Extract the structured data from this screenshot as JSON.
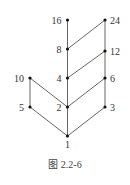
{
  "diagram": {
    "type": "hasse-diagram",
    "caption": "图 2.2-6",
    "nodes": [
      {
        "id": "1",
        "label": "1",
        "x": 67.5,
        "y": 136,
        "label_pos": "below"
      },
      {
        "id": "2",
        "label": "2",
        "x": 67.5,
        "y": 107,
        "label_pos": "left"
      },
      {
        "id": "3",
        "label": "3",
        "x": 105,
        "y": 107,
        "label_pos": "right"
      },
      {
        "id": "5",
        "label": "5",
        "x": 30,
        "y": 107,
        "label_pos": "left"
      },
      {
        "id": "4",
        "label": "4",
        "x": 67.5,
        "y": 78,
        "label_pos": "left"
      },
      {
        "id": "6",
        "label": "6",
        "x": 105,
        "y": 78,
        "label_pos": "right"
      },
      {
        "id": "10",
        "label": "10",
        "x": 30,
        "y": 78,
        "label_pos": "left"
      },
      {
        "id": "8",
        "label": "8",
        "x": 67.5,
        "y": 49,
        "label_pos": "left"
      },
      {
        "id": "12",
        "label": "12",
        "x": 105,
        "y": 51,
        "label_pos": "right"
      },
      {
        "id": "16",
        "label": "16",
        "x": 67.5,
        "y": 20,
        "label_pos": "left"
      },
      {
        "id": "24",
        "label": "24",
        "x": 105,
        "y": 20,
        "label_pos": "right"
      }
    ],
    "edges": [
      [
        "1",
        "2"
      ],
      [
        "1",
        "5"
      ],
      [
        "1",
        "3"
      ],
      [
        "2",
        "4"
      ],
      [
        "2",
        "10"
      ],
      [
        "2",
        "6"
      ],
      [
        "5",
        "10"
      ],
      [
        "3",
        "6"
      ],
      [
        "4",
        "8"
      ],
      [
        "4",
        "12"
      ],
      [
        "6",
        "12"
      ],
      [
        "8",
        "16"
      ],
      [
        "8",
        "24"
      ],
      [
        "12",
        "24"
      ]
    ]
  }
}
